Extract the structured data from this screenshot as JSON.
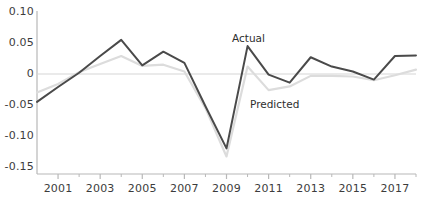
{
  "chart_data": {
    "type": "line",
    "title": "",
    "xlabel": "",
    "ylabel": "",
    "xlim": [
      2000,
      2018
    ],
    "ylim": [
      -0.15,
      0.1
    ],
    "grid": false,
    "zero_line": true,
    "legend_position": "inline-annotation",
    "x": [
      2000,
      2001,
      2002,
      2003,
      2004,
      2005,
      2006,
      2007,
      2008,
      2009,
      2010,
      2011,
      2012,
      2013,
      2014,
      2015,
      2016,
      2017,
      2018
    ],
    "series": [
      {
        "name": "Actual",
        "color": "#4a4a4a",
        "values": [
          -0.045,
          -0.021,
          0.002,
          0.029,
          0.055,
          0.014,
          0.036,
          0.018,
          -0.052,
          -0.12,
          0.045,
          -0.001,
          -0.014,
          0.027,
          0.012,
          0.004,
          -0.009,
          0.029,
          0.03
        ]
      },
      {
        "name": "Predicted",
        "color": "#dcdcdc",
        "values": [
          -0.03,
          -0.016,
          0.003,
          0.016,
          0.029,
          0.013,
          0.015,
          0.004,
          -0.055,
          -0.133,
          0.012,
          -0.026,
          -0.02,
          -0.003,
          -0.003,
          -0.004,
          -0.01,
          -0.002,
          0.007
        ]
      }
    ],
    "y_ticks": [
      {
        "value": 0.1,
        "label": "0.10"
      },
      {
        "value": 0.05,
        "label": "0.05"
      },
      {
        "value": 0.0,
        "label": "0"
      },
      {
        "value": -0.05,
        "label": "-0.05"
      },
      {
        "value": -0.1,
        "label": "-0.10"
      },
      {
        "value": -0.15,
        "label": "-0.15"
      }
    ],
    "x_ticks_major": [
      {
        "value": 2001,
        "label": "2001"
      },
      {
        "value": 2003,
        "label": "2003"
      },
      {
        "value": 2005,
        "label": "2005"
      },
      {
        "value": 2007,
        "label": "2007"
      },
      {
        "value": 2009,
        "label": "2009"
      },
      {
        "value": 2011,
        "label": "2011"
      },
      {
        "value": 2013,
        "label": "2013"
      },
      {
        "value": 2015,
        "label": "2015"
      },
      {
        "value": 2017,
        "label": "2017"
      }
    ],
    "x_ticks_minor": [
      2002,
      2004,
      2006,
      2008,
      2010,
      2012,
      2014,
      2016,
      2018
    ],
    "annotations": [
      {
        "text": "Actual",
        "x": 232,
        "y": 32,
        "series": "Actual"
      },
      {
        "text": "Predicted",
        "x": 250,
        "y": 98,
        "series": "Predicted"
      }
    ],
    "axis_color": "#b8b8b8",
    "zero_line_color": "#d6d6d6",
    "text_color": "#3c3c3c"
  }
}
